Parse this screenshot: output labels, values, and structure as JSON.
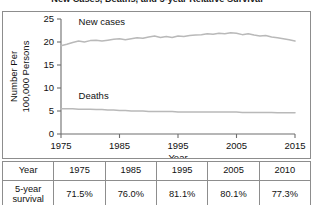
{
  "figure": {
    "title": "New Cases, Deaths, and 5-year Relative Survival"
  },
  "chart_data": {
    "type": "line",
    "title": "New Cases, Deaths, and 5-year Relative Survival",
    "xlabel": "Year",
    "ylabel": "Number Per 100,000 Persons",
    "ylabel_line1": "Number Per",
    "ylabel_line2": "100,000 Persons",
    "xlim": [
      1975,
      2015
    ],
    "ylim": [
      0,
      25
    ],
    "yticks": [
      0,
      5,
      10,
      15,
      20,
      25
    ],
    "ytick_labels": [
      "0",
      "5",
      "10",
      "15",
      "20",
      "25"
    ],
    "xticks": [
      1975,
      1985,
      1995,
      2005,
      2015
    ],
    "xtick_labels": [
      "1975",
      "1985",
      "1995",
      "2005",
      "2015"
    ],
    "grid": false,
    "legend_position": "inline-annotations",
    "line_color": "#b9b9b9",
    "series": [
      {
        "name": "New cases",
        "label_x": 1978,
        "label_y": 23.6,
        "x": [
          1975,
          1976,
          1977,
          1978,
          1979,
          1980,
          1981,
          1982,
          1983,
          1984,
          1985,
          1986,
          1987,
          1988,
          1989,
          1990,
          1991,
          1992,
          1993,
          1994,
          1995,
          1996,
          1997,
          1998,
          1999,
          2000,
          2001,
          2002,
          2003,
          2004,
          2005,
          2006,
          2007,
          2008,
          2009,
          2010,
          2011,
          2012,
          2013,
          2014,
          2015
        ],
        "values": [
          19.2,
          19.5,
          19.9,
          20.2,
          20.0,
          20.3,
          20.4,
          20.2,
          20.4,
          20.6,
          20.7,
          20.5,
          20.7,
          20.9,
          20.8,
          21.1,
          21.3,
          21.0,
          21.2,
          21.0,
          21.3,
          21.2,
          21.4,
          21.5,
          21.6,
          21.8,
          21.7,
          21.9,
          21.8,
          22.0,
          21.9,
          21.6,
          21.8,
          21.5,
          21.3,
          21.4,
          21.1,
          20.9,
          20.7,
          20.5,
          20.2
        ]
      },
      {
        "name": "Deaths",
        "label_x": 1978,
        "label_y": 7.6,
        "x": [
          1975,
          1976,
          1977,
          1978,
          1979,
          1980,
          1981,
          1982,
          1983,
          1984,
          1985,
          1986,
          1987,
          1988,
          1989,
          1990,
          1991,
          1992,
          1993,
          1994,
          1995,
          1996,
          1997,
          1998,
          1999,
          2000,
          2001,
          2002,
          2003,
          2004,
          2005,
          2006,
          2007,
          2008,
          2009,
          2010,
          2011,
          2012,
          2013,
          2014,
          2015
        ],
        "values": [
          5.5,
          5.5,
          5.5,
          5.4,
          5.4,
          5.4,
          5.3,
          5.3,
          5.2,
          5.2,
          5.1,
          5.1,
          5.0,
          5.0,
          5.0,
          4.9,
          4.9,
          4.9,
          4.9,
          4.9,
          4.8,
          4.8,
          4.8,
          4.8,
          4.8,
          4.8,
          4.8,
          4.8,
          4.8,
          4.8,
          4.8,
          4.7,
          4.7,
          4.7,
          4.7,
          4.7,
          4.7,
          4.6,
          4.6,
          4.6,
          4.6
        ]
      }
    ]
  },
  "table": {
    "header": [
      "Year",
      "1975",
      "1985",
      "1995",
      "2005",
      "2010"
    ],
    "rows": [
      {
        "label_line1": "5-year",
        "label_line2": "survival",
        "values": [
          "71.5%",
          "76.0%",
          "81.1%",
          "80.1%",
          "77.3%"
        ]
      }
    ]
  }
}
